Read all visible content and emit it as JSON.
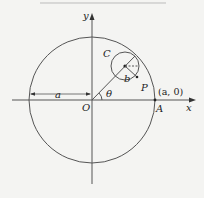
{
  "diagram": {
    "colors": {
      "background": "#f4f4f2",
      "stroke": "#555555",
      "text": "#222222"
    },
    "labels": {
      "x_axis": "x",
      "y_axis": "y",
      "origin": "O",
      "point_A": "A",
      "point_A_coords": "(a, 0)",
      "small_circle": "C",
      "point_P": "P",
      "small_radius": "b",
      "large_radius": "a",
      "angle": "θ"
    }
  }
}
